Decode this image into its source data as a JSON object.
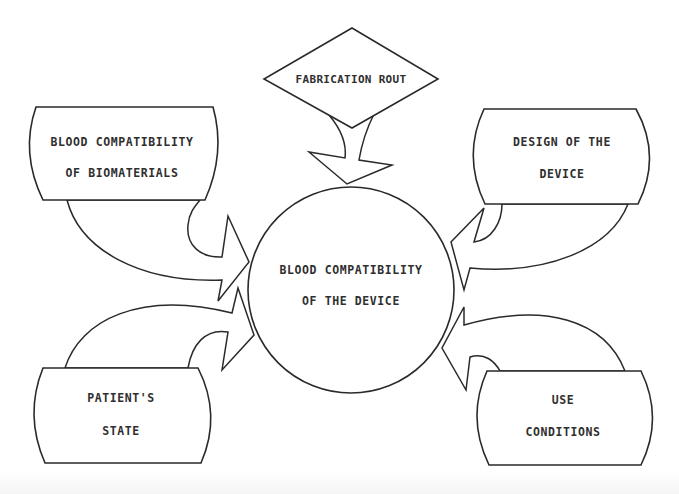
{
  "diagram": {
    "center": {
      "line1": "BLOOD  COMPATIBILITY",
      "line2": "OF THE DEVICE"
    },
    "top": {
      "label": "FABRICATION ROUT"
    },
    "top_left": {
      "line1": "BLOOD COMPATIBILITY",
      "line2": "OF BIOMATERIALS"
    },
    "top_right": {
      "line1": "DESIGN OF THE",
      "line2": "DEVICE"
    },
    "bottom_left": {
      "line1": "PATIENT'S",
      "line2": "STATE"
    },
    "bottom_right": {
      "line1": "USE",
      "line2": "CONDITIONS"
    },
    "colors": {
      "stroke": "#2a2a2a",
      "text": "#2f2f2f",
      "background": "#ffffff"
    }
  }
}
